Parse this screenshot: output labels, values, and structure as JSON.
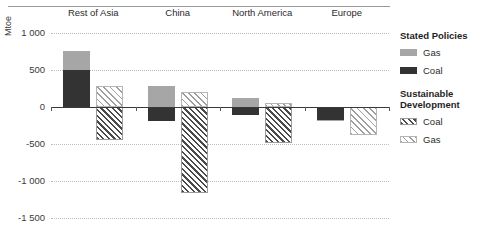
{
  "chart_data": {
    "type": "bar",
    "title": "",
    "xlabel": "",
    "ylabel": "Mtoe",
    "ylim": [
      -1500,
      1000
    ],
    "yticks": [
      1000,
      500,
      0,
      -500,
      -1000,
      -1500
    ],
    "ytick_labels": [
      "1 000",
      "500",
      "0",
      "-500",
      "-1 000",
      "-1 500"
    ],
    "grid": true,
    "legend_position": "right",
    "categories": [
      "Rest of Asia",
      "China",
      "North America",
      "Europe"
    ],
    "series": [
      {
        "name": "Stated Policies Coal",
        "group": "Stated Policies",
        "fuel": "Coal",
        "style": "solid-dark",
        "color": "#333333",
        "values": [
          500,
          -190,
          -110,
          -170
        ]
      },
      {
        "name": "Stated Policies Gas",
        "group": "Stated Policies",
        "fuel": "Gas",
        "style": "solid-light",
        "color": "#a6a6a6",
        "values": [
          260,
          290,
          120,
          -25
        ]
      },
      {
        "name": "Sustainable Development Coal",
        "group": "Sustainable Development",
        "fuel": "Coal",
        "style": "hatch-dark",
        "color": "#4a4a4a",
        "values": [
          -450,
          -1160,
          -480,
          0
        ]
      },
      {
        "name": "Sustainable Development Gas",
        "group": "Sustainable Development",
        "fuel": "Gas",
        "style": "hatch-light",
        "color": "#9e9e9e",
        "values": [
          290,
          200,
          50,
          -380
        ]
      }
    ]
  },
  "axis": {
    "y_title": "Mtoe"
  },
  "legend": {
    "group1": {
      "title": "Stated Policies",
      "items": [
        {
          "label": "Gas",
          "swatch": "solid-light"
        },
        {
          "label": "Coal",
          "swatch": "solid-dark"
        }
      ]
    },
    "group2": {
      "title_line1": "Sustainable",
      "title_line2": "Development",
      "items": [
        {
          "label": "Coal",
          "swatch": "hatch-dark"
        },
        {
          "label": "Gas",
          "swatch": "hatch-light"
        }
      ]
    }
  }
}
